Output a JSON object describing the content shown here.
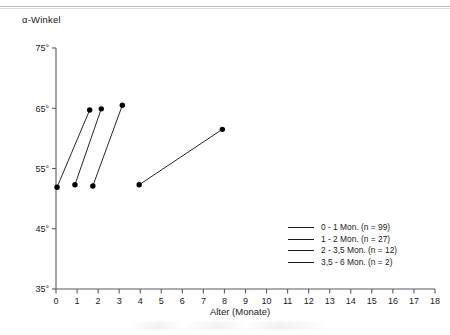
{
  "chart_data": {
    "type": "line",
    "title": "",
    "ylabel": "α-Winkel",
    "xlabel": "Alter (Monate)",
    "xlim": [
      0,
      18
    ],
    "ylim": [
      35,
      75
    ],
    "xticks": [
      0,
      1,
      2,
      3,
      4,
      5,
      6,
      7,
      8,
      9,
      10,
      11,
      12,
      13,
      14,
      15,
      16,
      17,
      18
    ],
    "xtick_labels": [
      "0",
      "1",
      "2",
      "3",
      "4",
      "5",
      "6",
      "7",
      "8",
      "9",
      "10",
      "11",
      "12",
      "13",
      "14",
      "15",
      "16",
      "17",
      "18"
    ],
    "yticks": [
      35,
      45,
      55,
      65,
      75
    ],
    "ytick_labels": [
      "35°",
      "45°",
      "55°",
      "65°",
      "75°"
    ],
    "grid": false,
    "legend_position": "lower-right",
    "series": [
      {
        "name": "0 - 1 Mon. (n = 99)",
        "points": [
          {
            "x": 0.05,
            "y": 51.9
          },
          {
            "x": 1.6,
            "y": 64.7
          }
        ]
      },
      {
        "name": "1 - 2 Mon. (n = 27)",
        "points": [
          {
            "x": 0.9,
            "y": 52.3
          },
          {
            "x": 2.15,
            "y": 64.9
          }
        ]
      },
      {
        "name": "2 - 3,5 Mon. (n = 12)",
        "points": [
          {
            "x": 1.75,
            "y": 52.1
          },
          {
            "x": 3.15,
            "y": 65.5
          }
        ]
      },
      {
        "name": "3,5 - 6 Mon. (n = 2)",
        "points": [
          {
            "x": 3.95,
            "y": 52.3
          },
          {
            "x": 7.9,
            "y": 61.5
          }
        ]
      }
    ]
  },
  "legend": {
    "entries": [
      {
        "label": "0 - 1 Mon. (n = 99)",
        "color": "#1a1a1a"
      },
      {
        "label": "1 - 2 Mon. (n = 27)",
        "color": "#1a1a1a"
      },
      {
        "label": "2 - 3,5 Mon. (n = 12)",
        "color": "#1a1a1a"
      },
      {
        "label": "3,5 - 6 Mon. (n = 2)",
        "color": "#1a1a1a"
      }
    ]
  },
  "axes": {
    "y_title": "α-Winkel",
    "x_title": "Alter (Monate)"
  },
  "colors": {
    "line": "#1a1a1a",
    "marker": "#000000",
    "axis": "#5a5a5a",
    "text": "#1a1a1a",
    "background": "#ffffff"
  }
}
